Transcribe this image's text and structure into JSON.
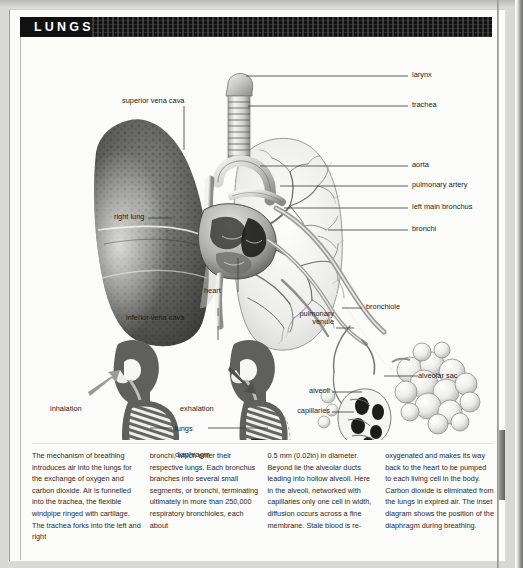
{
  "header": {
    "title": "LUNGS"
  },
  "diagram": {
    "labels": [
      {
        "name": "larynx",
        "text": "larynx"
      },
      {
        "name": "trachea",
        "text": "trachea"
      },
      {
        "name": "aorta",
        "text": "aorta"
      },
      {
        "name": "pulmonary-artery",
        "text": "pulmonary artery"
      },
      {
        "name": "left-main-bronchus",
        "text": "left main bronchus"
      },
      {
        "name": "bronchi",
        "text": "bronchi"
      },
      {
        "name": "bronchiole",
        "text": "bronchiole"
      },
      {
        "name": "alveolar-sac",
        "text": "alveolar sac"
      },
      {
        "name": "superior-vena-cava",
        "text": "superior vena cava"
      },
      {
        "name": "right-lung",
        "text": "right lung"
      },
      {
        "name": "heart",
        "text": "heart"
      },
      {
        "name": "inferior-vena-cava",
        "text": "inferior vena cava"
      },
      {
        "name": "pulmonary-venule-1",
        "text": "pulmonary"
      },
      {
        "name": "pulmonary-venule-2",
        "text": "venule"
      },
      {
        "name": "alveoli",
        "text": "alveoli"
      },
      {
        "name": "capillaries",
        "text": "capillaries"
      }
    ]
  },
  "inset": {
    "inhalation": "inhalation",
    "exhalation": "exhalation",
    "lungs": "lungs",
    "diaphragm": "diaphragm"
  },
  "body_text": {
    "column1": "The mechanism of breathing introduces air into the lungs for the exchange of oxygen and carbon dioxide. Air is funnelled into the trachea, the flexible windpipe ringed with cartilage. The trachea forks into the left and right",
    "column2": "bronchi, which enter their respective lungs. Each bronchus branches into several small segments, or bronchi, terminating ultimately in more than 250,000 respiratory bronchioles, each about",
    "column3": "0.5 mm (0.02in) in diameter. Beyond lie the alveolar ducts leading into hollow alveoli. Here in the alveoli, networked with capillaries only one cell in width, diffusion occurs across a fine membrane. Stale blood is re-",
    "column4": "oxygenated and makes its way back to the heart to be pumped to each living cell in the body. Carbon dioxide is eliminated from the lungs in expired air. The inset diagram shows the position of the diaphragm during breathing."
  },
  "colors": {
    "header_bg": "#111111",
    "page_bg": "#fbfbfa",
    "text": "#2a2a2a"
  }
}
